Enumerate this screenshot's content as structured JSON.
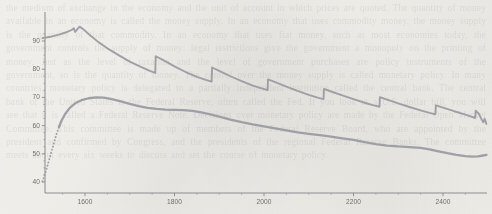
{
  "figure": {
    "background_color": "#f6f4f0",
    "line_color": "#9a9ca1",
    "tick_label_color": "#5c5c5c",
    "axis_color": "#7c7e83"
  },
  "background_text": "the medium of exchange in the economy and the unit of account in which prices are quoted. The quantity of money available in an economy is called the money supply. In an economy that uses commodity money, the money supply is the quantity of that commodity. In an economy that uses fiat money, such as most economies today, the government controls the supply of money: legal restrictions give the government a monopoly on the printing of money. Just as the level of taxation and the level of government purchases are policy instruments of the government, so is the quantity of money. The control over the money supply is called monetary policy. In many countries, monetary policy is delegated to a partially independent institution called the central bank. The central bank of the United States is the Federal Reserve, often called the Fed. If you look at a U.S. dollar bill, you will see that it is called a Federal Reserve Note. Decisions over monetary policy are made by the Federal Open Market Committee. This committee is made up of members of the Federal Reserve Board, who are appointed by the president and confirmed by Congress, and the presidents of the regional Federal Reserve Banks. The committee meets about every six weeks to discuss and set the course of monetary policy.",
  "chart_data": {
    "type": "line",
    "title": "",
    "xlabel": "",
    "ylabel": "",
    "xlim": [
      1500,
      2500
    ],
    "ylim": [
      38,
      96
    ],
    "grid": false,
    "legend": "none",
    "x_ticks": [
      1600,
      1800,
      2000,
      2200,
      2400
    ],
    "x_minor_ticks": [
      1500,
      1550,
      1650,
      1700,
      1750,
      1850,
      1900,
      1950,
      2050,
      2100,
      2150,
      2250,
      2300,
      2350,
      2450,
      2500
    ],
    "y_ticks": [
      40,
      50,
      60,
      70,
      80,
      90
    ],
    "series": [
      {
        "name": "upper-sawtooth-curve",
        "style": "solid",
        "description": "Rises from 91 to a double peak near 95, then declines in a sawtooth pattern with seven sharp upward jumps and gradual decays, ending near 60.",
        "points": [
          [
            1505,
            91.0
          ],
          [
            1520,
            91.4
          ],
          [
            1540,
            92.2
          ],
          [
            1560,
            93.2
          ],
          [
            1570,
            93.9
          ],
          [
            1575,
            94.5
          ],
          [
            1578,
            93.2
          ],
          [
            1582,
            94.0
          ],
          [
            1588,
            95.1
          ],
          [
            1596,
            94.2
          ],
          [
            1610,
            92.2
          ],
          [
            1630,
            89.6
          ],
          [
            1650,
            87.4
          ],
          [
            1675,
            85.0
          ],
          [
            1700,
            82.7
          ],
          [
            1725,
            80.8
          ],
          [
            1745,
            79.4
          ],
          [
            1757,
            78.7
          ],
          [
            1758,
            84.6
          ],
          [
            1775,
            83.2
          ],
          [
            1800,
            81.0
          ],
          [
            1825,
            79.0
          ],
          [
            1850,
            77.3
          ],
          [
            1870,
            76.2
          ],
          [
            1883,
            75.6
          ],
          [
            1884,
            80.6
          ],
          [
            1900,
            79.4
          ],
          [
            1925,
            77.5
          ],
          [
            1950,
            75.8
          ],
          [
            1975,
            74.2
          ],
          [
            1995,
            73.2
          ],
          [
            2008,
            72.6
          ],
          [
            2009,
            76.4
          ],
          [
            2025,
            75.4
          ],
          [
            2050,
            73.8
          ],
          [
            2075,
            72.3
          ],
          [
            2100,
            70.9
          ],
          [
            2120,
            69.9
          ],
          [
            2133,
            69.4
          ],
          [
            2134,
            73.0
          ],
          [
            2150,
            72.1
          ],
          [
            2175,
            70.7
          ],
          [
            2200,
            69.4
          ],
          [
            2225,
            68.1
          ],
          [
            2245,
            67.2
          ],
          [
            2258,
            66.7
          ],
          [
            2259,
            70.1
          ],
          [
            2275,
            69.2
          ],
          [
            2300,
            67.9
          ],
          [
            2325,
            66.6
          ],
          [
            2350,
            65.4
          ],
          [
            2370,
            64.5
          ],
          [
            2383,
            64.0
          ],
          [
            2384,
            67.2
          ],
          [
            2400,
            66.4
          ],
          [
            2425,
            65.1
          ],
          [
            2450,
            63.9
          ],
          [
            2465,
            63.1
          ],
          [
            2472,
            62.7
          ],
          [
            2473,
            65.3
          ],
          [
            2480,
            64.2
          ],
          [
            2486,
            62.3
          ],
          [
            2490,
            61.2
          ],
          [
            2493,
            62.4
          ],
          [
            2497,
            60.6
          ]
        ]
      },
      {
        "name": "lower-smooth-curve",
        "style": "dotted-then-solid",
        "dotted_until_x": 1545,
        "description": "Starts dotted at 40, rises steeply to about 62, then solid: peaks near 70 around x=1640 and then declines gently with small undulations to about 49 at the right edge.",
        "points": [
          [
            1505,
            40.2
          ],
          [
            1512,
            43.5
          ],
          [
            1518,
            46.8
          ],
          [
            1524,
            50.2
          ],
          [
            1530,
            53.5
          ],
          [
            1536,
            56.8
          ],
          [
            1542,
            59.6
          ],
          [
            1548,
            61.9
          ],
          [
            1556,
            64.2
          ],
          [
            1566,
            66.3
          ],
          [
            1578,
            67.9
          ],
          [
            1592,
            69.0
          ],
          [
            1608,
            69.7
          ],
          [
            1625,
            70.0
          ],
          [
            1642,
            69.9
          ],
          [
            1660,
            69.4
          ],
          [
            1680,
            68.6
          ],
          [
            1700,
            67.7
          ],
          [
            1720,
            66.9
          ],
          [
            1740,
            66.3
          ],
          [
            1760,
            65.9
          ],
          [
            1780,
            65.7
          ],
          [
            1800,
            65.6
          ],
          [
            1820,
            65.5
          ],
          [
            1840,
            65.2
          ],
          [
            1860,
            64.7
          ],
          [
            1880,
            64.0
          ],
          [
            1900,
            63.2
          ],
          [
            1925,
            62.1
          ],
          [
            1950,
            61.2
          ],
          [
            1975,
            60.4
          ],
          [
            2000,
            59.7
          ],
          [
            2025,
            59.0
          ],
          [
            2050,
            58.3
          ],
          [
            2075,
            57.6
          ],
          [
            2100,
            57.1
          ],
          [
            2125,
            56.6
          ],
          [
            2150,
            56.1
          ],
          [
            2175,
            55.5
          ],
          [
            2200,
            54.9
          ],
          [
            2225,
            54.1
          ],
          [
            2250,
            53.4
          ],
          [
            2275,
            52.9
          ],
          [
            2300,
            52.6
          ],
          [
            2325,
            52.4
          ],
          [
            2350,
            52.1
          ],
          [
            2370,
            51.6
          ],
          [
            2390,
            50.9
          ],
          [
            2410,
            50.2
          ],
          [
            2430,
            49.6
          ],
          [
            2450,
            49.2
          ],
          [
            2465,
            49.0
          ],
          [
            2478,
            49.1
          ],
          [
            2490,
            49.4
          ],
          [
            2497,
            49.6
          ]
        ]
      }
    ]
  }
}
